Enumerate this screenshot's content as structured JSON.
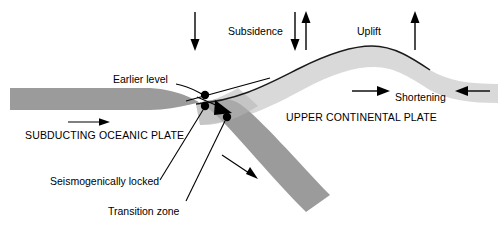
{
  "figure": {
    "background_color": "#ffffff",
    "width": 498,
    "height": 237
  },
  "colors": {
    "oceanic_plate": "#9b9b9b",
    "continental_plate": "#d9d9d9",
    "overlap_zone": "#b4b4b4",
    "line": "#000000",
    "text": "#000000"
  },
  "labels": {
    "subsidence": "Subsidence",
    "uplift": "Uplift",
    "shortening": "Shortening",
    "earlier_level": "Earlier level",
    "upper_continental_plate": "UPPER CONTINENTAL PLATE",
    "subducting_oceanic_plate": "SUBDUCTING OCEANIC PLATE",
    "seismogenically_locked": "Seismogenically locked",
    "transition_zone": "Transition zone"
  },
  "arrows": [
    {
      "name": "subsidence-down-arrow-left",
      "direction": "down",
      "x": 195,
      "y1": 12,
      "y2": 50
    },
    {
      "name": "subsidence-down-arrow-right",
      "direction": "down",
      "x": 295,
      "y1": 12,
      "y2": 50
    },
    {
      "name": "uplift-up-arrow-inner",
      "direction": "up",
      "x": 306,
      "y1": 50,
      "y2": 12
    },
    {
      "name": "uplift-up-arrow-right",
      "direction": "up",
      "x": 415,
      "y1": 50,
      "y2": 12
    },
    {
      "name": "shortening-arrow-right",
      "direction": "right",
      "y": 91,
      "x1": 352,
      "x2": 389
    },
    {
      "name": "shortening-arrow-left",
      "direction": "left",
      "y": 91,
      "x1": 490,
      "x2": 455
    },
    {
      "name": "oceanic-convergence-arrow",
      "direction": "right",
      "y": 122,
      "x1": 68,
      "x2": 108
    },
    {
      "name": "slab-descent-arrow",
      "direction": "down-right",
      "x1": 222,
      "y1": 155,
      "x2": 256,
      "y2": 178
    },
    {
      "name": "locked-zone-slip-arrow",
      "direction": "down-right-thick",
      "x1": 197,
      "y1": 98,
      "x2": 231,
      "y2": 112
    }
  ],
  "markers": [
    {
      "name": "earlier-level-point",
      "x": 205,
      "y": 95
    },
    {
      "name": "locked-zone-point",
      "x": 205,
      "y": 106
    },
    {
      "name": "transition-zone-point",
      "x": 227,
      "y": 117
    }
  ]
}
